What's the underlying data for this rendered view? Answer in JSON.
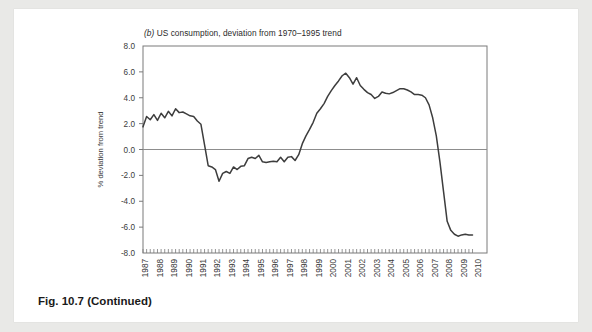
{
  "figure": {
    "caption_prefix": "Fig. 10.7",
    "caption_suffix": "(Continued)"
  },
  "chart_data": {
    "type": "line",
    "title": "(b) US consumption, deviation from 1970–1995 trend",
    "title_panel_letter": "(b)",
    "title_rest": "US consumption, deviation from 1970–1995 trend",
    "xlabel": "",
    "ylabel": "% deviation from trend",
    "ylim": [
      -8.0,
      8.0
    ],
    "ytick_labels": [
      "8.0",
      "6.0",
      "4.0",
      "2.0",
      "0.0",
      "-2.0",
      "-4.0",
      "-6.0",
      "-8.0"
    ],
    "ytick_values": [
      8.0,
      6.0,
      4.0,
      2.0,
      0.0,
      -2.0,
      -4.0,
      -6.0,
      -8.0
    ],
    "xlim": [
      1987.0,
      2010.75
    ],
    "xtick_labels": [
      "1987",
      "1988",
      "1989",
      "1990",
      "1991",
      "1992",
      "1993",
      "1994",
      "1995",
      "1996",
      "1997",
      "1998",
      "1999",
      "2000",
      "2001",
      "2002",
      "2003",
      "2004",
      "2005",
      "2006",
      "2007",
      "2008",
      "2009",
      "2010"
    ],
    "x_minor_tick_frequency": "quarterly",
    "grid": false,
    "legend": false,
    "zero_line": true,
    "line_color": "#3d3d3d",
    "frame_color": "#7a7a7a",
    "background": "#ffffff",
    "x_start": 1987.0,
    "x_step": 0.25,
    "series": [
      {
        "name": "US consumption deviation from trend",
        "values": [
          1.75,
          2.55,
          2.3,
          2.7,
          2.25,
          2.8,
          2.45,
          2.95,
          2.6,
          3.15,
          2.85,
          2.9,
          2.75,
          2.6,
          2.55,
          2.2,
          1.95,
          0.35,
          -1.25,
          -1.35,
          -1.55,
          -2.45,
          -1.85,
          -1.7,
          -1.85,
          -1.35,
          -1.55,
          -1.3,
          -1.25,
          -0.7,
          -0.6,
          -0.7,
          -0.45,
          -0.95,
          -1.0,
          -0.95,
          -0.9,
          -0.95,
          -0.6,
          -0.95,
          -0.6,
          -0.55,
          -0.85,
          -0.4,
          0.45,
          1.05,
          1.55,
          2.1,
          2.8,
          3.15,
          3.55,
          4.1,
          4.55,
          4.95,
          5.3,
          5.7,
          5.9,
          5.55,
          5.05,
          5.55,
          4.95,
          4.65,
          4.4,
          4.25,
          3.95,
          4.1,
          4.45,
          4.35,
          4.3,
          4.4,
          4.55,
          4.7,
          4.7,
          4.6,
          4.45,
          4.25,
          4.25,
          4.2,
          4.0,
          3.45,
          2.45,
          1.05,
          -0.95,
          -3.25,
          -5.55,
          -6.25,
          -6.55,
          -6.7,
          -6.6,
          -6.55,
          -6.6,
          -6.6
        ]
      }
    ]
  }
}
